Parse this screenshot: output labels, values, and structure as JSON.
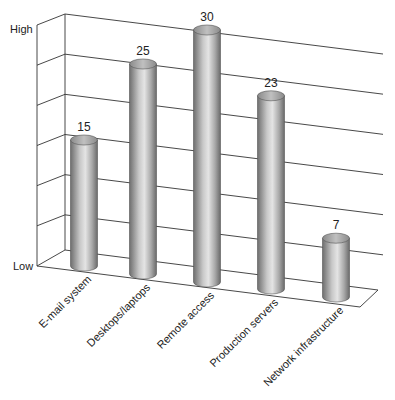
{
  "chart_data": {
    "type": "bar",
    "style": "3d-cylinder",
    "title": "",
    "xlabel": "",
    "ylabel": "",
    "y_tick_labels": [
      "Low",
      "High"
    ],
    "ylim": [
      0,
      30
    ],
    "grid": true,
    "legend": null,
    "categories": [
      "E-mail system",
      "Desktops/laptops",
      "Remote access",
      "Production servers",
      "Network infrastructure"
    ],
    "values": [
      15,
      25,
      30,
      23,
      7
    ],
    "data_labels": [
      "15",
      "25",
      "30",
      "23",
      "7"
    ],
    "colors": {
      "bar_dark": "#6e6e6e",
      "bar_light": "#e4e4e4",
      "bar_top": "#9a9a9a",
      "grid": "#333333",
      "text": "#222222"
    }
  },
  "axis": {
    "high_label": "High",
    "low_label": "Low"
  }
}
